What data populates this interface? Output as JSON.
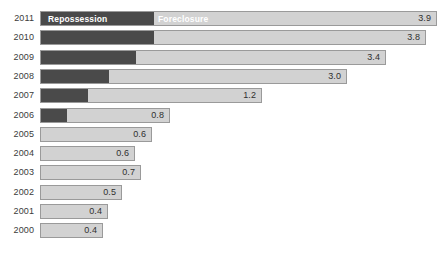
{
  "chart_data": {
    "type": "bar",
    "title": "",
    "subtitle": "",
    "xlabel": "",
    "ylabel": "",
    "orientation": "horizontal",
    "stacked": true,
    "grid": false,
    "legend_position": "in-bar-first-row",
    "xlim": [
      0,
      3.9
    ],
    "categories": [
      "2011",
      "2010",
      "2009",
      "2008",
      "2007",
      "2006",
      "2005",
      "2004",
      "2003",
      "2002",
      "2001",
      "2000"
    ],
    "series": [
      {
        "name": "Repossession",
        "color": "#4a4a4a",
        "values": [
          1.1,
          1.1,
          0.93,
          0.67,
          0.46,
          0.25,
          0,
          0,
          0,
          0,
          0,
          0
        ]
      },
      {
        "name": "Foreclosure",
        "color": "#d2d2d2",
        "values": [
          2.8,
          2.7,
          2.47,
          2.33,
          0.74,
          0.55,
          0.6,
          0.6,
          0.7,
          0.5,
          0.4,
          0.4
        ]
      }
    ],
    "totals": [
      3.9,
      3.8,
      3.4,
      3.0,
      1.2,
      0.8,
      0.6,
      0.6,
      0.7,
      0.5,
      0.4,
      0.4
    ],
    "value_labels": [
      "3.9",
      "3.8",
      "3.4",
      "3.0",
      "1.2",
      "0.8",
      "0.6",
      "0.6",
      "0.7",
      "0.5",
      "0.4",
      "0.4"
    ],
    "legend_entries": [
      {
        "label": "Repossession",
        "color": "#4a4a4a"
      },
      {
        "label": "Foreclosure",
        "color": "#d2d2d2"
      }
    ]
  },
  "rows": [
    {
      "year": "2011",
      "value": "3.9",
      "dark_end_px": 153,
      "bar_end_px": 437,
      "show_legend": true
    },
    {
      "year": "2010",
      "value": "3.8",
      "dark_end_px": 153,
      "bar_end_px": 426,
      "show_legend": false
    },
    {
      "year": "2009",
      "value": "3.4",
      "dark_end_px": 135,
      "bar_end_px": 386,
      "show_legend": false
    },
    {
      "year": "2008",
      "value": "3.0",
      "dark_end_px": 108,
      "bar_end_px": 347,
      "show_legend": false
    },
    {
      "year": "2007",
      "value": "1.2",
      "dark_end_px": 87,
      "bar_end_px": 262,
      "show_legend": false
    },
    {
      "year": "2006",
      "value": "0.8",
      "dark_end_px": 66,
      "bar_end_px": 170,
      "show_legend": false
    },
    {
      "year": "2005",
      "value": "0.6",
      "dark_end_px": 40,
      "bar_end_px": 152,
      "show_legend": false
    },
    {
      "year": "2004",
      "value": "0.6",
      "dark_end_px": 40,
      "bar_end_px": 135,
      "show_legend": false
    },
    {
      "year": "2003",
      "value": "0.7",
      "dark_end_px": 40,
      "bar_end_px": 141,
      "show_legend": false
    },
    {
      "year": "2002",
      "value": "0.5",
      "dark_end_px": 40,
      "bar_end_px": 122,
      "show_legend": false
    },
    {
      "year": "2001",
      "value": "0.4",
      "dark_end_px": 40,
      "bar_end_px": 108,
      "show_legend": false
    },
    {
      "year": "2000",
      "value": "0.4",
      "dark_end_px": 40,
      "bar_end_px": 103,
      "show_legend": false
    }
  ],
  "legend": {
    "repossession_label": "Repossession",
    "foreclosure_label": "Foreclosure"
  },
  "colors": {
    "dark_segment": "#4a4a4a",
    "light_segment": "#d2d2d2",
    "bar_border": "#9a9a9a",
    "year_text": "#3b3b3b",
    "value_text": "#2f2f2f",
    "legend_text": "#ffffff",
    "background": "#ffffff"
  },
  "geometry": {
    "bar_left_px": 40,
    "row_pitch_px": 19.3,
    "first_row_top_px": 11,
    "bar_height_px": 15
  }
}
